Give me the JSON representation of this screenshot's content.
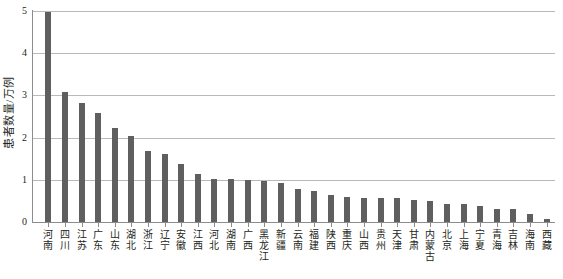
{
  "chart_data": {
    "type": "bar",
    "title": "",
    "subtitle": "",
    "xlabel": "",
    "ylabel": "患者数量/万例",
    "ylim": [
      0,
      5
    ],
    "yticks": [
      0,
      1,
      2,
      3,
      4,
      5
    ],
    "ytick_labels": [
      "0",
      "1",
      "2",
      "3",
      "4",
      "5"
    ],
    "grid": true,
    "legend": "none",
    "bar_color": "#5f5f5f",
    "gridline_color": "#b9b9b9",
    "axis_color": "#8c8c8c",
    "categories": [
      "河南",
      "四川",
      "江苏",
      "广东",
      "山东",
      "湖北",
      "浙江",
      "辽宁",
      "安徽",
      "江西",
      "河北",
      "湖南",
      "广西",
      "黑龙江",
      "新疆",
      "云南",
      "福建",
      "陕西",
      "重庆",
      "山西",
      "贵州",
      "天津",
      "甘肃",
      "内蒙古",
      "北京",
      "上海",
      "宁夏",
      "青海",
      "吉林",
      "海南",
      "西藏"
    ],
    "values": [
      4.97,
      3.08,
      2.82,
      2.58,
      2.22,
      2.05,
      1.68,
      1.62,
      1.38,
      1.13,
      1.02,
      1.01,
      1.0,
      0.97,
      0.93,
      0.78,
      0.73,
      0.65,
      0.6,
      0.58,
      0.57,
      0.57,
      0.52,
      0.5,
      0.43,
      0.42,
      0.37,
      0.32,
      0.3,
      0.2,
      0.06
    ]
  }
}
